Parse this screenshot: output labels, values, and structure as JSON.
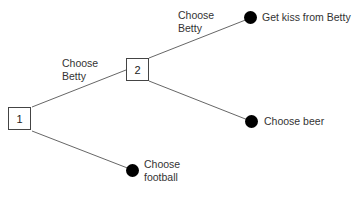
{
  "diagram": {
    "type": "decision-tree",
    "nodes": [
      {
        "id": "1",
        "kind": "decision",
        "label": "1"
      },
      {
        "id": "2",
        "kind": "decision",
        "label": "2"
      },
      {
        "id": "kiss",
        "kind": "outcome",
        "label": "Get kiss from Betty"
      },
      {
        "id": "beer",
        "kind": "outcome",
        "label": "Choose beer"
      },
      {
        "id": "football",
        "kind": "outcome",
        "label_lines": [
          "Choose",
          "football"
        ]
      }
    ],
    "edges": [
      {
        "from": "1",
        "to": "2",
        "label_lines": [
          "Choose",
          "Betty"
        ]
      },
      {
        "from": "1",
        "to": "football",
        "label_lines": []
      },
      {
        "from": "2",
        "to": "kiss",
        "label_lines": [
          "Choose",
          "Betty"
        ]
      },
      {
        "from": "2",
        "to": "beer",
        "label_lines": []
      }
    ]
  },
  "colors": {
    "line": "#555555",
    "dot": "#000000",
    "text": "#333333"
  }
}
